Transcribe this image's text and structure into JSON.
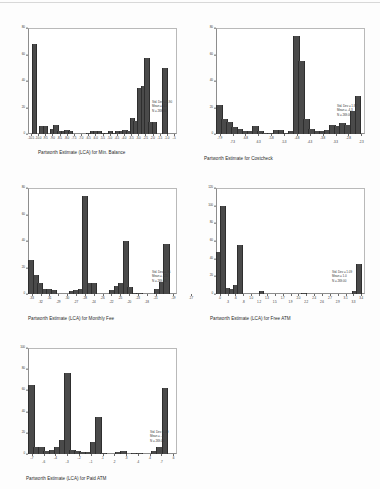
{
  "document": {
    "title": "Partworth Estimate Histograms",
    "background_color": "#fdfdfd",
    "bar_color": "#4a4a4a",
    "axis_color": "#8d8d8d"
  },
  "chart_data": [
    {
      "id": "min-balance",
      "type": "bar",
      "title": "Partworth Estimate (LCA) for Min. Balance",
      "xlabel": "Partworth Estimate (LCA) for Min. Balance",
      "ylabel": "",
      "ylim": [
        0,
        80
      ],
      "yticks": [
        0,
        20,
        40,
        60,
        80
      ],
      "grid": false,
      "legend": "none",
      "xticks": [
        "-10.5",
        "-10.0",
        "-9.5",
        "-9.0",
        "-8.5",
        "-8.0",
        "-7.5",
        "-7.0",
        "-6.5",
        "-6.0",
        "-5.5",
        "-5.0",
        "-4.5",
        "-4.0",
        "-3.5",
        "-3.0",
        "-2.5",
        "-2.0",
        "-1.5",
        "-1.0",
        "-.5"
      ],
      "categories": [
        "-10.5",
        "-10.25",
        "-10.0",
        "-9.75",
        "-9.5",
        "-9.25",
        "-9.0",
        "-8.75",
        "-8.5",
        "-8.25",
        "-8.0",
        "-7.75",
        "-7.5",
        "-7.25",
        "-7.0",
        "-6.75",
        "-6.5",
        "-6.25",
        "-6.0",
        "-5.75",
        "-5.5",
        "-5.25",
        "-5.0",
        "-4.75",
        "-4.5",
        "-4.25",
        "-4.0",
        "-3.75",
        "-3.5",
        "-3.25",
        "-3.0",
        "-2.75",
        "-2.5",
        "-2.25",
        "-2.0",
        "-1.75",
        "-1.5",
        "-1.25",
        "-1.0",
        "-.75",
        "-.5"
      ],
      "values": [
        0,
        68,
        0,
        6,
        6,
        0,
        4,
        7,
        2,
        2,
        3,
        2,
        0,
        0,
        0,
        0,
        1,
        2,
        2,
        2,
        1,
        1,
        2,
        1,
        2,
        2,
        3,
        2,
        12,
        10,
        35,
        36,
        57,
        9,
        9,
        0,
        0,
        50,
        0,
        0,
        0
      ],
      "stats": {
        "std_dev": "Std. Dev = 3.90",
        "mean": "Mean = -4.4",
        "n": "N = 269.00"
      }
    },
    {
      "id": "costcheck",
      "type": "bar",
      "title": "Partworth Estimate for Costcheck",
      "xlabel": "Partworth Estimate for Costcheck",
      "ylabel": "",
      "ylim": [
        0,
        80
      ],
      "yticks": [
        0,
        20,
        40,
        60,
        80
      ],
      "grid": false,
      "legend": "none",
      "xticks": [
        "-7.9",
        "-6.8",
        "-5.8",
        "-4.8",
        "-3.8",
        "-2.8"
      ],
      "xticks_low": [
        "-7.3",
        "-6.3",
        "-5.3",
        "-4.3",
        "-3.3",
        "-2.3"
      ],
      "categories": [
        "-7.9",
        "-7.7",
        "-7.5",
        "-7.3",
        "-7.1",
        "-6.9",
        "-6.7",
        "-6.5",
        "-6.3",
        "-6.1",
        "-5.9",
        "-5.7",
        "-5.5",
        "-5.3",
        "-5.1",
        "-4.9",
        "-4.7",
        "-4.5",
        "-4.3",
        "-4.1",
        "-3.9",
        "-3.7",
        "-3.5",
        "-3.3",
        "-3.1",
        "-2.9",
        "-2.7",
        "-2.5",
        "-2.3"
      ],
      "values": [
        22,
        11,
        9,
        5,
        4,
        2,
        2,
        6,
        2,
        1,
        1,
        3,
        3,
        1,
        2,
        74,
        55,
        11,
        4,
        2,
        2,
        3,
        7,
        6,
        8,
        7,
        17,
        29,
        0
      ],
      "stats": {
        "std_dev": "Std. Dev = 1.87",
        "mean": "Mean = -4.3",
        "n": "N = 269.00"
      }
    },
    {
      "id": "monthly-fee",
      "type": "bar",
      "title": "Partworth Estimate (LCA) for Monthly Fee",
      "xlabel": "Partworth Estimate (LCA) for Monthly Fee",
      "ylabel": "",
      "ylim": [
        0,
        80
      ],
      "yticks": [
        0,
        20,
        40,
        60,
        80
      ],
      "grid": false,
      "legend": "none",
      "xticks": [
        "-33",
        "-31",
        "-30",
        "-28",
        "-26",
        "-25",
        "-23",
        "-21",
        "-19",
        "-17"
      ],
      "xticks_low": [
        "-32",
        "-29",
        "-27",
        "-24",
        "-22",
        "-20",
        "-18"
      ],
      "categories": [
        "-33",
        "-32.5",
        "-32",
        "-31.5",
        "-31",
        "-30.5",
        "-30",
        "-29.5",
        "-29",
        "-28.5",
        "-28",
        "-27.5",
        "-27",
        "-26.5",
        "-26",
        "-25.5",
        "-25",
        "-24.5",
        "-24",
        "-23.5",
        "-23",
        "-22.5",
        "-22",
        "-21.5",
        "-21",
        "-20.5",
        "-20",
        "-19.5",
        "-19",
        "-18.5",
        "-18",
        "-17.5",
        "-17"
      ],
      "values": [
        26,
        14,
        8,
        4,
        4,
        3,
        0,
        0,
        0,
        2,
        3,
        4,
        74,
        8,
        8,
        0,
        0,
        0,
        3,
        6,
        8,
        40,
        5,
        1,
        1,
        0,
        0,
        0,
        4,
        9,
        38,
        0,
        0
      ],
      "stats": {
        "std_dev": "Std. Dev = .95",
        "mean": "Mean = -.25",
        "n": "N = 269.00"
      }
    },
    {
      "id": "free-atm",
      "type": "bar",
      "title": "Partworth Estimate (LCA) for Free ATM",
      "xlabel": "Partworth Estimate (LCA) for Free ATM",
      "ylabel": "",
      "ylim": [
        0,
        120
      ],
      "yticks": [
        0,
        20,
        40,
        60,
        80,
        100,
        120
      ],
      "grid": false,
      "legend": "none",
      "xticks": [
        ".0",
        ".6",
        "1.0",
        "1.3",
        "1.7",
        "2.0",
        "2.4",
        "2.7",
        "3.1",
        "3.4"
      ],
      "xticks_low": [
        ".3",
        ".8",
        "1.2",
        "1.5",
        "1.9",
        "2.2",
        "2.6",
        "2.9",
        "3.3"
      ],
      "categories": [
        ".0",
        ".1",
        ".2",
        ".3",
        ".4",
        ".5",
        ".6",
        ".7",
        ".8",
        ".9",
        "1.0",
        "1.1",
        "1.2",
        "1.3",
        "1.4",
        "1.5",
        "1.6",
        "1.7",
        "1.8",
        "1.9",
        "2.0",
        "2.1",
        "2.2",
        "2.3",
        "2.4",
        "2.5",
        "2.6",
        "2.7",
        "2.8",
        "2.9",
        "3.0",
        "3.1",
        "3.2",
        "3.3",
        "3.4"
      ],
      "values": [
        48,
        100,
        7,
        6,
        10,
        56,
        0,
        0,
        0,
        0,
        3,
        0,
        0,
        0,
        0,
        0,
        0,
        0,
        0,
        0,
        1,
        0,
        0,
        0,
        0,
        0,
        0,
        0,
        0,
        0,
        0,
        0,
        3,
        34,
        0
      ],
      "stats": {
        "std_dev": "Std. Dev = 1.09",
        "mean": "Mean = 1.0",
        "n": "N = 269.00"
      }
    },
    {
      "id": "paid-atm",
      "type": "bar",
      "title": "Partworth Estimate (LCA) for Paid ATM",
      "xlabel": "Partworth Estimate (LCA) for Paid ATM",
      "ylabel": "",
      "ylim": [
        0,
        100
      ],
      "yticks": [
        0,
        20,
        40,
        60,
        80,
        100
      ],
      "grid": false,
      "legend": "none",
      "xticks": [
        "-.7",
        "-.4",
        "-.2",
        ".1",
        ".3",
        ".4",
        ".6"
      ],
      "xticks_low": [
        "-.6",
        "-.3",
        "-.1",
        ".2",
        ".4",
        ".7"
      ],
      "categories": [
        "-.7",
        "-.65",
        "-.6",
        "-.55",
        "-.5",
        "-.45",
        "-.4",
        "-.35",
        "-.3",
        "-.25",
        "-.2",
        "-.15",
        "-.1",
        "-.05",
        ".0",
        ".05",
        ".1",
        ".15",
        ".2",
        ".25",
        ".3",
        ".35",
        ".4",
        ".45",
        ".5",
        ".55",
        ".6",
        ".65",
        ".7"
      ],
      "values": [
        65,
        7,
        7,
        3,
        4,
        7,
        13,
        76,
        4,
        3,
        2,
        2,
        11,
        35,
        1,
        0,
        0,
        2,
        3,
        0,
        1,
        1,
        0,
        0,
        3,
        7,
        62,
        0,
        0
      ],
      "stats": {
        "std_dev": "Std. Dev = .49",
        "mean": "Mean = -.2",
        "n": "N = 269.00"
      }
    }
  ]
}
